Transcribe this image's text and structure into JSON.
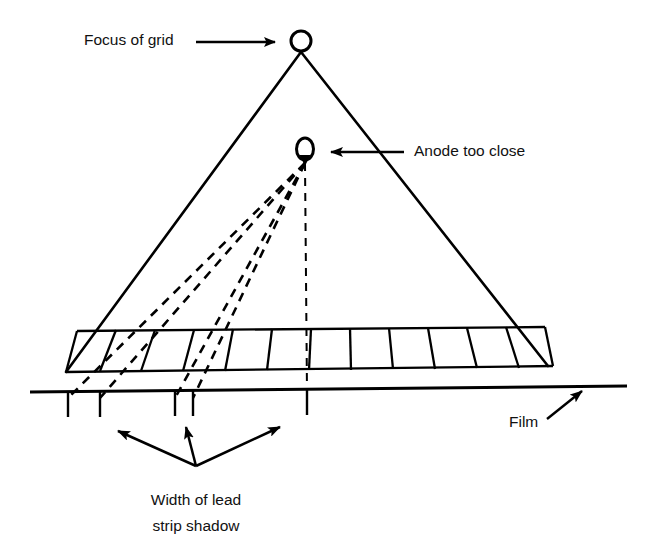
{
  "figure": {
    "background_color": "#ffffff",
    "line_color": "#000000",
    "width": 653,
    "height": 552
  },
  "labels": {
    "focus_of_grid": "Focus of grid",
    "anode_too_close": "Anode too close",
    "film": "Film",
    "width_of_lead_line1": "Width of lead",
    "width_of_lead_line2": "strip shadow"
  },
  "annotations": [
    {
      "id": "focus-of-grid",
      "text": "Focus of grid",
      "text_x": 84,
      "text_y": 41,
      "arrow": {
        "from_x": 196,
        "to_x": 281,
        "y": 42,
        "direction": "right"
      }
    },
    {
      "id": "anode-too-close",
      "text": "Anode too close",
      "text_x": 414,
      "text_y": 152,
      "arrow": {
        "from_x": 404,
        "to_x": 326,
        "y": 152,
        "direction": "left"
      }
    },
    {
      "id": "film",
      "text": "Film",
      "text_x": 509,
      "text_y": 423,
      "arrow": {
        "from_x": 547,
        "from_y": 419,
        "to_x": 585,
        "to_y": 389,
        "direction": "up-right"
      }
    },
    {
      "id": "width-of-lead-strip-shadow",
      "text_line_1": "Width of lead",
      "text_line_2": "strip shadow",
      "text_x": 196,
      "text_y_line_1": 501,
      "text_y_line_2": 527,
      "fan_origin_x": 196,
      "fan_origin_y": 466,
      "arrow_targets": [
        {
          "x": 112,
          "y": 428
        },
        {
          "x": 186,
          "y": 421
        },
        {
          "x": 285,
          "y": 423
        }
      ]
    }
  ],
  "nodes": [
    {
      "id": "grid-focus-point",
      "shape": "circle",
      "cx": 301,
      "cy": 41,
      "rx": 10,
      "ry": 10
    },
    {
      "id": "anode-point",
      "shape": "ellipse",
      "cx": 305,
      "cy": 149,
      "rx": 8.5,
      "ry": 11
    }
  ],
  "geometry": {
    "apex_x": 301,
    "apex_y": 52,
    "left_base_x": 66,
    "left_base_y": 372,
    "right_base_x": 548,
    "right_base_y": 366,
    "grid_band": {
      "top_left_x": 77,
      "top_left_y": 331,
      "top_right_x": 545,
      "top_right_y": 327,
      "bottom_left_x": 66,
      "bottom_left_y": 372,
      "bottom_right_x": 553,
      "bottom_right_y": 366,
      "cell_count": 12
    },
    "film_line": {
      "x1": 30,
      "y1": 392,
      "x2": 627,
      "y2": 386
    },
    "film_ticks": [
      {
        "x": 68,
        "y_top": 392,
        "y_bottom": 417
      },
      {
        "x": 100,
        "y_top": 391,
        "y_bottom": 417
      },
      {
        "x": 175,
        "y_top": 390,
        "y_bottom": 416
      },
      {
        "x": 193,
        "y_top": 390,
        "y_bottom": 416
      },
      {
        "x": 307,
        "y_top": 389,
        "y_bottom": 415
      }
    ],
    "anode_rays": [
      {
        "id": "ray-1a",
        "x1": 305,
        "y1": 163,
        "x2": 68,
        "y2": 398
      },
      {
        "id": "ray-1b",
        "x1": 305,
        "y1": 163,
        "x2": 100,
        "y2": 398
      },
      {
        "id": "ray-2a",
        "x1": 305,
        "y1": 163,
        "x2": 175,
        "y2": 398
      },
      {
        "id": "ray-2b",
        "x1": 305,
        "y1": 163,
        "x2": 193,
        "y2": 398
      },
      {
        "id": "ray-center",
        "x1": 305,
        "y1": 163,
        "x2": 307,
        "y2": 392
      }
    ]
  }
}
